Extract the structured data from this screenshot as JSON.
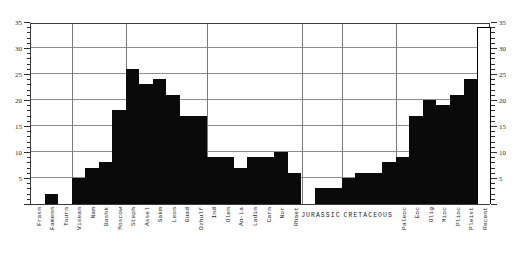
{
  "chart_data": {
    "type": "bar",
    "title": "",
    "subtitle": "",
    "xlabel": "",
    "ylabel": "",
    "ylim": [
      0,
      35
    ],
    "ytick_step_major": 5,
    "ytick_step_minor": 1,
    "grid": true,
    "legend": "none",
    "axis_labels_left": [
      "35",
      "30",
      "25",
      "20",
      "15",
      "10",
      "5"
    ],
    "axis_labels_right": [
      "35",
      "30",
      "25",
      "20",
      "15",
      "10",
      "5"
    ],
    "categories": [
      "Frasn",
      "Famenn",
      "Tourn",
      "Visean",
      "Nam",
      "Bashk",
      "Moscow",
      "Steph",
      "Assel",
      "Sakm",
      "Leon",
      "Guad",
      "Dzhulf",
      "Ind",
      "Olen",
      "An-La",
      "Ladin",
      "Carn",
      "Nor",
      "Rhaet",
      "JURASSIC-1",
      "JURASSIC-2",
      "JURASSIC-3",
      "CRETACEOUS-1",
      "CRETACEOUS-2",
      "CRETACEOUS-3",
      "CRETACEOUS-4",
      "Paleoc",
      "Eoc",
      "Olig",
      "Mioc",
      "Plioc",
      "Pleist",
      "Recent"
    ],
    "tick_labels": [
      "Frasn",
      "Famenn",
      "Tourn",
      "Visean",
      "Nam",
      "Bashk",
      "Moscow",
      "Steph",
      "Assel",
      "Sakm",
      "Leon",
      "Guad",
      "Dzhulf",
      "Ind",
      "Olen",
      "An-La",
      "Ladin",
      "Carn",
      "Nor",
      "Rhaet",
      "",
      "",
      "",
      "",
      "",
      "",
      "",
      "Paleoc",
      "Eoc",
      "Olig",
      "Mioc",
      "Plioc",
      "Pleist",
      "Recent"
    ],
    "values": [
      0,
      2,
      0,
      5,
      7,
      8,
      18,
      26,
      23,
      24,
      21,
      17,
      17,
      9,
      9,
      7,
      9,
      9,
      10,
      6,
      0,
      3,
      3,
      5,
      6,
      6,
      8,
      9,
      17,
      20,
      19,
      21,
      24,
      34
    ],
    "bar_styles": [
      "filled",
      "filled",
      "filled",
      "filled",
      "filled",
      "filled",
      "filled",
      "filled",
      "filled",
      "filled",
      "filled",
      "filled",
      "filled",
      "filled",
      "filled",
      "filled",
      "filled",
      "filled",
      "filled",
      "filled",
      "filled",
      "filled",
      "filled",
      "filled",
      "filled",
      "filled",
      "filled",
      "filled",
      "filled",
      "filled",
      "filled",
      "filled",
      "filled",
      "outline"
    ],
    "period_labels": [
      {
        "text": "JURASSIC",
        "start_index": 20,
        "end_index": 22
      },
      {
        "text": "CRETACEOUS",
        "start_index": 23,
        "end_index": 26
      }
    ],
    "period_dividers": [
      3,
      7,
      13,
      20,
      23,
      27
    ],
    "colors": {
      "bar_fill": "#0a0a0a",
      "bar_outline": "#000000",
      "grid": "#8d8d8d",
      "axis": "#3a3a3a",
      "background": "#ffffff",
      "text": "#262626"
    }
  }
}
